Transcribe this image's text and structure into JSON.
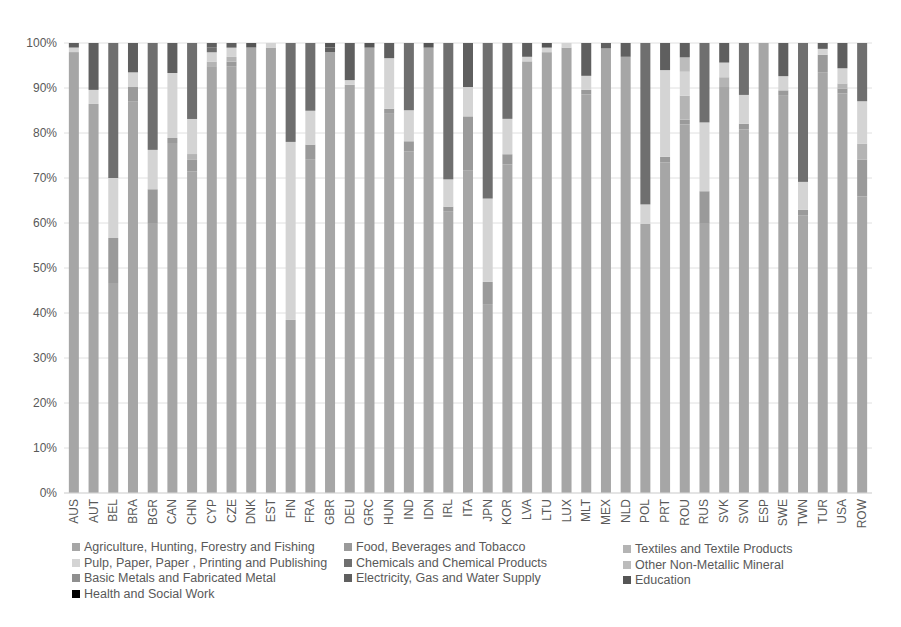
{
  "chart_data": {
    "type": "bar",
    "stacked": true,
    "normalized_percent": true,
    "title": "",
    "xlabel": "",
    "ylabel": "",
    "ylim": [
      0,
      100
    ],
    "yticks": [
      "0%",
      "10%",
      "20%",
      "30%",
      "40%",
      "50%",
      "60%",
      "70%",
      "80%",
      "90%",
      "100%"
    ],
    "grid": true,
    "legend_position": "bottom",
    "categories": [
      "AUS",
      "AUT",
      "BEL",
      "BRA",
      "BGR",
      "CAN",
      "CHN",
      "CYP",
      "CZE",
      "DNK",
      "EST",
      "FIN",
      "FRA",
      "GBR",
      "DEU",
      "GRC",
      "HUN",
      "IND",
      "IDN",
      "IRL",
      "ITA",
      "JPN",
      "KOR",
      "LVA",
      "LTU",
      "LUX",
      "MLT",
      "MEX",
      "NLD",
      "POL",
      "PRT",
      "ROU",
      "RUS",
      "SVK",
      "SVN",
      "ESP",
      "SWE",
      "TWN",
      "TUR",
      "USA",
      "ROW"
    ],
    "series": [
      {
        "name": "Agriculture, Hunting, Forestry and Fishing",
        "color": "#a6a6a6",
        "values": [
          97,
          83,
          42,
          80,
          48,
          70,
          55,
          92,
          92,
          99,
          97,
          35,
          69,
          97,
          88,
          97,
          75,
          66,
          97,
          62,
          66,
          34,
          65,
          94,
          96,
          97,
          85,
          82,
          95,
          55,
          61,
          77,
          51,
          83,
          63,
          97,
          84,
          50,
          72,
          79,
          56
        ]
      },
      {
        "name": "Food, Beverages and Tobacco",
        "color": "#9a9a9a",
        "values": [
          0,
          0,
          9,
          3,
          6,
          1,
          2,
          0,
          1,
          0,
          0,
          0,
          3,
          0,
          0,
          0,
          1,
          2,
          0,
          1,
          11,
          4,
          2,
          0,
          0,
          0,
          1,
          0,
          0,
          0,
          1,
          1,
          6,
          0,
          1,
          0,
          1,
          1,
          3,
          1,
          7
        ]
      },
      {
        "name": "Textiles and Textile Products",
        "color": "#b4b4b4",
        "values": [
          0,
          0,
          0,
          0,
          0,
          0,
          1,
          1,
          1,
          0,
          0,
          0,
          0,
          0,
          0,
          0,
          0,
          0,
          0,
          0,
          0,
          0,
          0,
          0,
          0,
          0,
          0,
          0,
          0,
          0,
          0,
          5,
          0,
          2,
          0,
          0,
          0,
          0,
          0,
          1,
          3
        ]
      },
      {
        "name": "Pulp, Paper, Paper , Printing and Publishing",
        "color": "#d4d4d4",
        "values": [
          1,
          3,
          12,
          3,
          7,
          13,
          6,
          2,
          2,
          0,
          1,
          36,
          7,
          0,
          1,
          0,
          10,
          6,
          0,
          6,
          6,
          15,
          7,
          1,
          1,
          1,
          3,
          0,
          0,
          4,
          16,
          5,
          13,
          3,
          5,
          0,
          3,
          5,
          1,
          3,
          8
        ]
      },
      {
        "name": "Chemicals and Chemical Products",
        "color": "#6f6f6f",
        "values": [
          0,
          0,
          27,
          0,
          19,
          0,
          13,
          1,
          0,
          0,
          0,
          20,
          14,
          0,
          0,
          0,
          0,
          13,
          0,
          30,
          0,
          28,
          15,
          0,
          0,
          0,
          0,
          0,
          0,
          33,
          0,
          0,
          15,
          0,
          9,
          0,
          0,
          25,
          0,
          0,
          11
        ]
      },
      {
        "name": "Other Non-Metallic Mineral",
        "color": "#bcbcbc",
        "values": [
          0,
          0,
          0,
          0,
          0,
          0,
          0,
          0,
          0,
          0,
          0,
          0,
          0,
          0,
          0,
          0,
          0,
          0,
          0,
          0,
          0,
          0,
          0,
          0,
          0,
          0,
          0,
          0,
          0,
          0,
          0,
          3,
          0,
          0,
          0,
          0,
          0,
          0,
          0,
          0,
          0
        ]
      },
      {
        "name": "Basic Metals and Fabricated Metal",
        "color": "#8f8f8f",
        "values": [
          0,
          0,
          0,
          0,
          0,
          0,
          0,
          0,
          0,
          0,
          0,
          0,
          0,
          0,
          0,
          0,
          0,
          0,
          0,
          0,
          0,
          0,
          0,
          0,
          0,
          0,
          0,
          0,
          0,
          0,
          0,
          0,
          0,
          0,
          0,
          0,
          0,
          0,
          0,
          0,
          0
        ]
      },
      {
        "name": "Electricity, Gas and Water Supply",
        "color": "#5f5f5f",
        "values": [
          1,
          10,
          0,
          6,
          0,
          6,
          0,
          1,
          1,
          0,
          0,
          0,
          0,
          1,
          8,
          0,
          3,
          0,
          0,
          0,
          9,
          0,
          0,
          3,
          0,
          0,
          7,
          1,
          3,
          0,
          5,
          3,
          0,
          4,
          0,
          0,
          7,
          0,
          1,
          5,
          0
        ]
      },
      {
        "name": "Education",
        "color": "#555555",
        "values": [
          0,
          0,
          0,
          0,
          0,
          0,
          0,
          0,
          0,
          1,
          0,
          0,
          0,
          1,
          0,
          1,
          0,
          0,
          1,
          0,
          0,
          0,
          0,
          0,
          1,
          0,
          0,
          0,
          0,
          0,
          0,
          0,
          0,
          0,
          0,
          0,
          0,
          0,
          0,
          0,
          0
        ]
      },
      {
        "name": "Health and Social Work",
        "color": "#000000",
        "values": [
          0,
          0,
          0,
          0,
          0,
          0,
          0,
          0,
          0,
          0,
          0,
          0,
          0,
          0,
          0,
          0,
          0,
          0,
          0,
          0,
          0,
          0,
          0,
          0,
          0,
          0,
          0,
          0,
          0,
          0,
          0,
          0,
          0,
          0,
          0,
          0,
          0,
          0,
          0,
          0,
          0
        ]
      }
    ]
  },
  "legend": {
    "items": [
      {
        "label": "Agriculture, Hunting, Forestry and Fishing",
        "color": "#a6a6a6"
      },
      {
        "label": "Food, Beverages and Tobacco",
        "color": "#9a9a9a"
      },
      {
        "label": "Textiles and Textile Products",
        "color": "#b4b4b4"
      },
      {
        "label": "Pulp, Paper, Paper , Printing and Publishing",
        "color": "#d4d4d4"
      },
      {
        "label": "Chemicals and Chemical Products",
        "color": "#6f6f6f"
      },
      {
        "label": "Other Non-Metallic Mineral",
        "color": "#bcbcbc"
      },
      {
        "label": "Basic Metals and Fabricated Metal",
        "color": "#8f8f8f"
      },
      {
        "label": "Electricity, Gas and Water Supply",
        "color": "#5f5f5f"
      },
      {
        "label": "Education",
        "color": "#555555"
      },
      {
        "label": "Health and Social Work",
        "color": "#000000"
      }
    ]
  }
}
